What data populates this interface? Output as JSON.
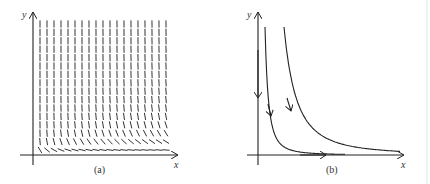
{
  "figure": {
    "panels": [
      {
        "id": "a",
        "caption": "(a)",
        "type": "direction-field",
        "x_axis_label": "x",
        "y_axis_label": "y",
        "description": "Slope field: arrows point steeply downward at large y, bending toward the positive x-axis near y = 0"
      },
      {
        "id": "b",
        "caption": "(b)",
        "type": "phase-portrait",
        "x_axis_label": "x",
        "y_axis_label": "y",
        "description": "Trajectories: y-axis flows downward toward origin, x-axis flows rightward; two hyperbola-like curves descend and approach the x-axis"
      }
    ]
  },
  "colors": {
    "ink": "#222222",
    "background": "#ffffff",
    "border": "#dddddd"
  },
  "field": {
    "cols": 19,
    "rows": 16,
    "x0": 40,
    "x1": 166,
    "y0": 24,
    "y1": 150
  }
}
